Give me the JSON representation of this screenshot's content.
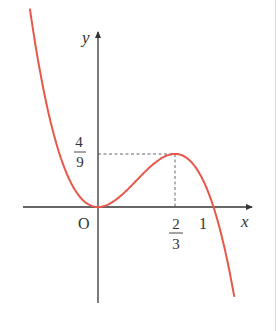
{
  "chart_data": {
    "type": "line",
    "title": "",
    "function": "y = 3x^2 - 3x^3",
    "xlabel": "x",
    "ylabel": "y",
    "origin_label": "O",
    "x_ticks": [
      {
        "value": 0.6667,
        "label_num": "2",
        "label_den": "3"
      },
      {
        "value": 1,
        "label": "1"
      }
    ],
    "y_ticks": [
      {
        "value": 0.4444,
        "label_num": "4",
        "label_den": "9"
      }
    ],
    "key_points": [
      {
        "name": "origin (local min)",
        "x": 0,
        "y": 0
      },
      {
        "name": "local max",
        "x": 0.6667,
        "y": 0.4444
      },
      {
        "name": "x-intercept",
        "x": 1,
        "y": 0
      }
    ],
    "xlim": [
      -0.65,
      1.33
    ],
    "ylim": [
      -0.82,
      1.47
    ],
    "grid": false,
    "legend": null,
    "curve_color": "#e8574a",
    "axis_color": "#333333",
    "guide_style": "dashed"
  },
  "labels": {
    "y_axis": "y",
    "x_axis": "x",
    "origin": "O",
    "y_max_num": "4",
    "y_max_den": "9",
    "x_max_num": "2",
    "x_max_den": "3",
    "x_one": "1"
  }
}
